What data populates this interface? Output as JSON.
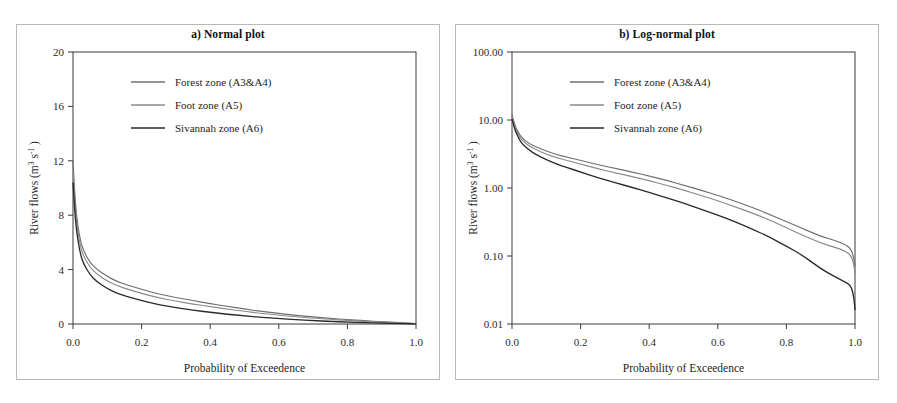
{
  "figure": {
    "background_color": "#ffffff",
    "frame_color": "#b9b9b9",
    "axis_color": "#3a3a3a"
  },
  "panels": [
    {
      "id": "normal",
      "title": "a) Normal plot",
      "xlabel": "Probability of Exceedence",
      "ylabel_base": "River flows (m",
      "ylabel_sup1": "3",
      "ylabel_mid": " s",
      "ylabel_sup2": "-1",
      "ylabel_end": " )"
    },
    {
      "id": "lognormal",
      "title": "b) Log-normal plot",
      "xlabel": "Probability of Exceedence",
      "ylabel_base": "River flows (m",
      "ylabel_sup1": "3",
      "ylabel_mid": " s",
      "ylabel_sup2": "-1",
      "ylabel_end": " )"
    }
  ],
  "legend": {
    "items": [
      {
        "label": "Forest zone (A3&A4)",
        "color": "#6f6f6f",
        "key": "forest"
      },
      {
        "label": "Foot zone (A5)",
        "color": "#8a8a8a",
        "key": "foot"
      },
      {
        "label": "Sivannah zone (A6)",
        "color": "#2b2b2b",
        "key": "savannah"
      }
    ]
  },
  "chart_data": [
    {
      "type": "line",
      "title": "a) Normal plot",
      "xlabel": "Probability of Exceedence",
      "ylabel": "River flows (m3 s-1)",
      "xscale": "linear",
      "yscale": "linear",
      "xlim": [
        0.0,
        1.0
      ],
      "ylim": [
        0,
        20
      ],
      "xticks": [
        0.0,
        0.2,
        0.4,
        0.6,
        0.8,
        1.0
      ],
      "xticklabels": [
        "0.0",
        "0.2",
        "0.4",
        "0.6",
        "0.8",
        "1.0"
      ],
      "yticks": [
        0,
        4,
        8,
        12,
        16,
        20
      ],
      "yticklabels": [
        "0",
        "4",
        "8",
        "12",
        "16",
        "20"
      ],
      "grid": false,
      "legend_position": "upper-center",
      "x": [
        0.0,
        0.005,
        0.01,
        0.02,
        0.03,
        0.05,
        0.07,
        0.1,
        0.13,
        0.16,
        0.2,
        0.25,
        0.3,
        0.35,
        0.4,
        0.45,
        0.5,
        0.55,
        0.6,
        0.65,
        0.7,
        0.75,
        0.8,
        0.85,
        0.9,
        0.95,
        0.98,
        0.995,
        1.0
      ],
      "series": [
        {
          "name": "Forest zone (A3&A4)",
          "color": "#6f6f6f",
          "values": [
            12.0,
            9.6,
            8.0,
            6.3,
            5.4,
            4.5,
            4.0,
            3.5,
            3.1,
            2.85,
            2.55,
            2.2,
            1.95,
            1.72,
            1.5,
            1.3,
            1.1,
            0.93,
            0.78,
            0.64,
            0.52,
            0.41,
            0.32,
            0.24,
            0.17,
            0.11,
            0.07,
            0.04,
            0.02
          ]
        },
        {
          "name": "Foot zone (A5)",
          "color": "#8a8a8a",
          "values": [
            11.2,
            9.0,
            7.5,
            5.9,
            5.0,
            4.15,
            3.65,
            3.15,
            2.8,
            2.55,
            2.25,
            1.92,
            1.68,
            1.47,
            1.28,
            1.1,
            0.93,
            0.78,
            0.65,
            0.53,
            0.43,
            0.34,
            0.26,
            0.19,
            0.13,
            0.08,
            0.05,
            0.03,
            0.015
          ]
        },
        {
          "name": "Sivannah zone (A6)",
          "color": "#2b2b2b",
          "values": [
            10.4,
            8.3,
            6.9,
            5.3,
            4.45,
            3.6,
            3.1,
            2.6,
            2.25,
            2.0,
            1.72,
            1.42,
            1.2,
            1.02,
            0.86,
            0.72,
            0.6,
            0.49,
            0.4,
            0.32,
            0.25,
            0.19,
            0.14,
            0.1,
            0.065,
            0.038,
            0.024,
            0.016,
            0.012
          ]
        }
      ]
    },
    {
      "type": "line",
      "title": "b) Log-normal plot",
      "xlabel": "Probability of Exceedence",
      "ylabel": "River flows (m3 s-1)",
      "xscale": "linear",
      "yscale": "log",
      "xlim": [
        0.0,
        1.0
      ],
      "ylim": [
        0.01,
        100.0
      ],
      "xticks": [
        0.0,
        0.2,
        0.4,
        0.6,
        0.8,
        1.0
      ],
      "xticklabels": [
        "0.0",
        "0.2",
        "0.4",
        "0.6",
        "0.8",
        "1.0"
      ],
      "yticks": [
        0.01,
        0.1,
        1.0,
        10.0,
        100.0
      ],
      "yticklabels": [
        "0.01",
        "0.10",
        "1.00",
        "10.00",
        "100.00"
      ],
      "grid": false,
      "legend_position": "upper-center",
      "x": [
        0.0,
        0.005,
        0.01,
        0.02,
        0.03,
        0.05,
        0.07,
        0.1,
        0.13,
        0.16,
        0.2,
        0.25,
        0.3,
        0.35,
        0.4,
        0.45,
        0.5,
        0.55,
        0.6,
        0.65,
        0.7,
        0.75,
        0.8,
        0.85,
        0.9,
        0.94,
        0.97,
        0.99,
        0.998,
        1.0
      ],
      "series": [
        {
          "name": "Forest zone (A3&A4)",
          "color": "#6f6f6f",
          "values": [
            12.0,
            9.6,
            8.0,
            6.3,
            5.4,
            4.5,
            4.0,
            3.5,
            3.1,
            2.85,
            2.55,
            2.2,
            1.95,
            1.72,
            1.5,
            1.3,
            1.1,
            0.93,
            0.78,
            0.64,
            0.52,
            0.41,
            0.32,
            0.25,
            0.195,
            0.17,
            0.15,
            0.125,
            0.085,
            0.07
          ]
        },
        {
          "name": "Foot zone (A5)",
          "color": "#8a8a8a",
          "values": [
            11.2,
            9.0,
            7.5,
            5.9,
            5.0,
            4.15,
            3.65,
            3.15,
            2.8,
            2.55,
            2.25,
            1.92,
            1.68,
            1.47,
            1.28,
            1.1,
            0.93,
            0.78,
            0.65,
            0.53,
            0.43,
            0.34,
            0.26,
            0.2,
            0.155,
            0.135,
            0.12,
            0.1,
            0.07,
            0.055
          ]
        },
        {
          "name": "Sivannah zone (A6)",
          "color": "#2b2b2b",
          "values": [
            10.4,
            8.3,
            6.9,
            5.3,
            4.45,
            3.6,
            3.1,
            2.6,
            2.25,
            2.0,
            1.72,
            1.42,
            1.2,
            1.02,
            0.86,
            0.72,
            0.6,
            0.49,
            0.4,
            0.32,
            0.25,
            0.19,
            0.14,
            0.1,
            0.065,
            0.05,
            0.042,
            0.036,
            0.022,
            0.016
          ]
        }
      ]
    }
  ]
}
